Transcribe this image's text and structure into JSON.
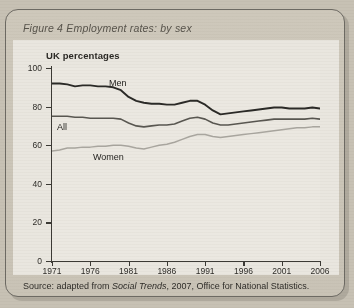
{
  "figure": {
    "caption": "Figure 4  Employment rates: by sex",
    "subtitle": "UK percentages",
    "source_prefix": "Source:  adapted from ",
    "source_italic": "Social Trends",
    "source_suffix": ", 2007, Office for National Statistics."
  },
  "colors": {
    "men": "#2b2a27",
    "all": "#595751",
    "women": "#a9a69f",
    "axis": "#3c3a35",
    "grid": "#cfccc4",
    "panel": "#e9e6df",
    "page": "#c7c1b4"
  },
  "labels": {
    "men": "Men",
    "all": "All",
    "women": "Women"
  },
  "chart_data": {
    "type": "line",
    "title": "Figure 4  Employment rates: by sex",
    "subtitle": "UK percentages",
    "xlabel": "",
    "ylabel": "UK percentages",
    "xlim": [
      1971,
      2006
    ],
    "ylim": [
      0,
      100
    ],
    "grid": true,
    "legend": "inline-labels",
    "yticks": [
      0,
      20,
      40,
      60,
      80,
      100
    ],
    "xticks": [
      1971,
      1976,
      1981,
      1986,
      1991,
      1996,
      2001,
      2006
    ],
    "x": [
      1971,
      1972,
      1973,
      1974,
      1975,
      1976,
      1977,
      1978,
      1979,
      1980,
      1981,
      1982,
      1983,
      1984,
      1985,
      1986,
      1987,
      1988,
      1989,
      1990,
      1991,
      1992,
      1993,
      1994,
      1995,
      1996,
      1997,
      1998,
      1999,
      2000,
      2001,
      2002,
      2003,
      2004,
      2005,
      2006
    ],
    "series": [
      {
        "name": "Men",
        "color": "#2b2a27",
        "values": [
          92,
          92,
          91.5,
          90.5,
          91,
          91,
          90.5,
          90.5,
          90,
          88.5,
          85,
          83,
          82,
          81.5,
          81.5,
          81,
          81,
          82,
          83,
          83,
          81,
          78,
          76,
          76.5,
          77,
          77.5,
          78,
          78.5,
          79,
          79.5,
          79.5,
          79,
          79,
          79,
          79.5,
          79
        ]
      },
      {
        "name": "All",
        "color": "#595751",
        "values": [
          75,
          75,
          75,
          74.5,
          74.5,
          74,
          74,
          74,
          74,
          73.5,
          71.5,
          70,
          69.5,
          70,
          70.5,
          70.5,
          71,
          72.5,
          74,
          74.5,
          73.5,
          71.5,
          70.5,
          70.5,
          71,
          71.5,
          72,
          72.5,
          73,
          73.5,
          73.5,
          73.5,
          73.5,
          73.5,
          74,
          73.5
        ]
      },
      {
        "name": "Women",
        "color": "#a9a69f",
        "values": [
          57,
          57.5,
          58.5,
          58.5,
          59,
          59,
          59.5,
          59.5,
          60,
          60,
          59.5,
          58.5,
          58,
          59,
          60,
          60.5,
          61.5,
          63,
          64.5,
          65.5,
          65.5,
          64.5,
          64,
          64.5,
          65,
          65.5,
          66,
          66.5,
          67,
          67.5,
          68,
          68.5,
          69,
          69,
          69.5,
          69.5
        ]
      }
    ]
  }
}
